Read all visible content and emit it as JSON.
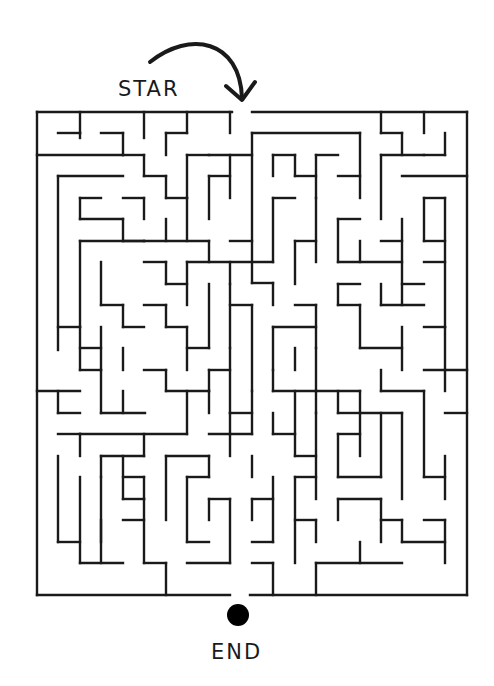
{
  "puzzle": {
    "start_label": "STAR",
    "end_label": "END",
    "wall_color": "#1a1a1a",
    "background_color": "#ffffff",
    "start_arrow": {
      "path": "M150,62 C190,30 240,40 242,98",
      "head": [
        [
          226,
          86
        ],
        [
          242,
          100
        ],
        [
          255,
          82
        ]
      ]
    },
    "end_marker": {
      "cx": 238,
      "cy": 615,
      "r": 11,
      "color": "#000000"
    },
    "entrance_gap": [
      232,
      252
    ],
    "exit_gap": [
      230,
      250
    ],
    "walls": [
      [
        37,
        112,
        232,
        112
      ],
      [
        252,
        112,
        467,
        112
      ],
      [
        37,
        112,
        37,
        595
      ],
      [
        467,
        112,
        467,
        595
      ],
      [
        37,
        595,
        230,
        595
      ],
      [
        250,
        595,
        467,
        595
      ],
      [
        37,
        155,
        123,
        155
      ],
      [
        80,
        133,
        80,
        138
      ],
      [
        58,
        133,
        80,
        133
      ],
      [
        80,
        112,
        80,
        133
      ],
      [
        101,
        133,
        123,
        133
      ],
      [
        123,
        133,
        123,
        155
      ],
      [
        144,
        112,
        144,
        138
      ],
      [
        166,
        133,
        187,
        133
      ],
      [
        187,
        112,
        187,
        133
      ],
      [
        166,
        133,
        166,
        155
      ],
      [
        123,
        155,
        144,
        155
      ],
      [
        144,
        155,
        144,
        176
      ],
      [
        144,
        176,
        166,
        176
      ],
      [
        166,
        176,
        166,
        198
      ],
      [
        187,
        155,
        209,
        155
      ],
      [
        187,
        155,
        187,
        198
      ],
      [
        209,
        155,
        252,
        155
      ],
      [
        230,
        112,
        230,
        133
      ],
      [
        58,
        176,
        58,
        350
      ],
      [
        58,
        176,
        123,
        176
      ],
      [
        80,
        198,
        80,
        219
      ],
      [
        80,
        198,
        101,
        198
      ],
      [
        80,
        219,
        123,
        219
      ],
      [
        123,
        219,
        123,
        241
      ],
      [
        123,
        241,
        144,
        241
      ],
      [
        123,
        198,
        144,
        198
      ],
      [
        144,
        198,
        144,
        219
      ],
      [
        166,
        198,
        187,
        198
      ],
      [
        187,
        198,
        187,
        241
      ],
      [
        166,
        219,
        166,
        241
      ],
      [
        144,
        241,
        209,
        241
      ],
      [
        209,
        176,
        230,
        176
      ],
      [
        209,
        176,
        209,
        219
      ],
      [
        230,
        155,
        230,
        198
      ],
      [
        230,
        241,
        252,
        241
      ],
      [
        252,
        133,
        252,
        283
      ],
      [
        252,
        133,
        360,
        133
      ],
      [
        273,
        155,
        295,
        155
      ],
      [
        273,
        155,
        273,
        176
      ],
      [
        295,
        155,
        295,
        176
      ],
      [
        295,
        176,
        316,
        176
      ],
      [
        316,
        155,
        316,
        198
      ],
      [
        316,
        155,
        338,
        155
      ],
      [
        273,
        198,
        295,
        198
      ],
      [
        273,
        198,
        273,
        262
      ],
      [
        338,
        176,
        360,
        176
      ],
      [
        360,
        133,
        360,
        198
      ],
      [
        381,
        112,
        381,
        133
      ],
      [
        381,
        133,
        402,
        133
      ],
      [
        402,
        133,
        402,
        155
      ],
      [
        424,
        112,
        424,
        133
      ],
      [
        445,
        133,
        445,
        155
      ],
      [
        424,
        155,
        445,
        155
      ],
      [
        381,
        155,
        424,
        155
      ],
      [
        381,
        155,
        381,
        219
      ],
      [
        402,
        176,
        467,
        176
      ],
      [
        424,
        198,
        445,
        198
      ],
      [
        424,
        198,
        424,
        241
      ],
      [
        80,
        241,
        80,
        327
      ],
      [
        80,
        241,
        144,
        241
      ],
      [
        101,
        262,
        101,
        305
      ],
      [
        101,
        305,
        123,
        305
      ],
      [
        123,
        305,
        123,
        327
      ],
      [
        123,
        327,
        144,
        327
      ],
      [
        144,
        262,
        166,
        262
      ],
      [
        166,
        262,
        166,
        284
      ],
      [
        166,
        284,
        187,
        284
      ],
      [
        187,
        262,
        187,
        305
      ],
      [
        187,
        262,
        273,
        262
      ],
      [
        209,
        241,
        209,
        262
      ],
      [
        230,
        262,
        230,
        284
      ],
      [
        252,
        283,
        273,
        283
      ],
      [
        273,
        283,
        273,
        305
      ],
      [
        295,
        241,
        295,
        284
      ],
      [
        295,
        241,
        316,
        241
      ],
      [
        316,
        198,
        316,
        262
      ],
      [
        338,
        219,
        360,
        219
      ],
      [
        338,
        219,
        338,
        262
      ],
      [
        338,
        262,
        402,
        262
      ],
      [
        360,
        241,
        360,
        262
      ],
      [
        381,
        241,
        402,
        241
      ],
      [
        402,
        219,
        402,
        305
      ],
      [
        402,
        284,
        424,
        284
      ],
      [
        424,
        241,
        445,
        241
      ],
      [
        445,
        198,
        445,
        327
      ],
      [
        424,
        262,
        445,
        262
      ],
      [
        58,
        327,
        80,
        327
      ],
      [
        80,
        327,
        80,
        370
      ],
      [
        80,
        348,
        101,
        348
      ],
      [
        101,
        327,
        101,
        370
      ],
      [
        123,
        348,
        123,
        370
      ],
      [
        144,
        305,
        166,
        305
      ],
      [
        166,
        305,
        166,
        327
      ],
      [
        166,
        327,
        187,
        327
      ],
      [
        187,
        327,
        187,
        370
      ],
      [
        187,
        348,
        209,
        348
      ],
      [
        209,
        284,
        209,
        348
      ],
      [
        230,
        284,
        230,
        348
      ],
      [
        230,
        305,
        252,
        305
      ],
      [
        252,
        305,
        252,
        391
      ],
      [
        209,
        370,
        230,
        370
      ],
      [
        230,
        348,
        230,
        413
      ],
      [
        273,
        327,
        273,
        370
      ],
      [
        273,
        327,
        316,
        327
      ],
      [
        295,
        305,
        316,
        305
      ],
      [
        316,
        305,
        316,
        348
      ],
      [
        338,
        284,
        360,
        284
      ],
      [
        338,
        284,
        338,
        305
      ],
      [
        338,
        305,
        360,
        305
      ],
      [
        360,
        305,
        360,
        348
      ],
      [
        360,
        348,
        402,
        348
      ],
      [
        381,
        305,
        424,
        305
      ],
      [
        381,
        284,
        381,
        305
      ],
      [
        402,
        327,
        402,
        370
      ],
      [
        424,
        327,
        445,
        327
      ],
      [
        445,
        327,
        445,
        370
      ],
      [
        424,
        370,
        467,
        370
      ],
      [
        37,
        391,
        80,
        391
      ],
      [
        58,
        391,
        58,
        413
      ],
      [
        58,
        413,
        80,
        413
      ],
      [
        80,
        370,
        101,
        370
      ],
      [
        101,
        370,
        101,
        413
      ],
      [
        101,
        413,
        145,
        413
      ],
      [
        123,
        391,
        123,
        413
      ],
      [
        144,
        370,
        166,
        370
      ],
      [
        166,
        370,
        166,
        391
      ],
      [
        166,
        391,
        209,
        391
      ],
      [
        209,
        370,
        209,
        391
      ],
      [
        187,
        391,
        187,
        434
      ],
      [
        209,
        391,
        209,
        413
      ],
      [
        230,
        413,
        252,
        413
      ],
      [
        230,
        413,
        230,
        434
      ],
      [
        252,
        391,
        252,
        434
      ],
      [
        273,
        370,
        273,
        391
      ],
      [
        273,
        391,
        316,
        391
      ],
      [
        295,
        348,
        295,
        370
      ],
      [
        316,
        348,
        316,
        413
      ],
      [
        316,
        391,
        360,
        391
      ],
      [
        338,
        391,
        338,
        413
      ],
      [
        338,
        413,
        360,
        413
      ],
      [
        360,
        391,
        360,
        456
      ],
      [
        381,
        370,
        381,
        391
      ],
      [
        381,
        391,
        424,
        391
      ],
      [
        424,
        391,
        424,
        477
      ],
      [
        445,
        370,
        445,
        391
      ],
      [
        58,
        434,
        80,
        434
      ],
      [
        80,
        434,
        80,
        456
      ],
      [
        58,
        456,
        58,
        542
      ],
      [
        58,
        542,
        80,
        542
      ],
      [
        80,
        434,
        187,
        434
      ],
      [
        101,
        456,
        101,
        477
      ],
      [
        101,
        456,
        144,
        456
      ],
      [
        144,
        434,
        144,
        456
      ],
      [
        101,
        477,
        101,
        542
      ],
      [
        123,
        477,
        144,
        477
      ],
      [
        123,
        456,
        123,
        499
      ],
      [
        144,
        477,
        144,
        499
      ],
      [
        166,
        456,
        166,
        520
      ],
      [
        166,
        456,
        209,
        456
      ],
      [
        187,
        477,
        209,
        477
      ],
      [
        187,
        477,
        187,
        542
      ],
      [
        209,
        456,
        209,
        477
      ],
      [
        209,
        434,
        252,
        434
      ],
      [
        230,
        434,
        230,
        456
      ],
      [
        252,
        456,
        252,
        477
      ],
      [
        273,
        413,
        273,
        434
      ],
      [
        273,
        434,
        295,
        434
      ],
      [
        295,
        391,
        295,
        456
      ],
      [
        295,
        456,
        316,
        456
      ],
      [
        316,
        413,
        316,
        499
      ],
      [
        338,
        434,
        360,
        434
      ],
      [
        338,
        434,
        338,
        477
      ],
      [
        338,
        477,
        381,
        477
      ],
      [
        381,
        413,
        381,
        477
      ],
      [
        360,
        413,
        402,
        413
      ],
      [
        402,
        413,
        402,
        499
      ],
      [
        424,
        477,
        445,
        477
      ],
      [
        445,
        456,
        445,
        499
      ],
      [
        445,
        413,
        467,
        413
      ],
      [
        80,
        477,
        80,
        563
      ],
      [
        80,
        563,
        123,
        563
      ],
      [
        123,
        499,
        144,
        499
      ],
      [
        123,
        520,
        144,
        520
      ],
      [
        144,
        499,
        144,
        563
      ],
      [
        101,
        520,
        101,
        563
      ],
      [
        144,
        563,
        166,
        563
      ],
      [
        166,
        563,
        166,
        595
      ],
      [
        187,
        542,
        209,
        542
      ],
      [
        187,
        563,
        230,
        563
      ],
      [
        209,
        499,
        230,
        499
      ],
      [
        209,
        499,
        209,
        520
      ],
      [
        230,
        499,
        230,
        563
      ],
      [
        252,
        499,
        273,
        499
      ],
      [
        252,
        499,
        252,
        520
      ],
      [
        273,
        477,
        273,
        542
      ],
      [
        252,
        542,
        273,
        542
      ],
      [
        295,
        477,
        316,
        477
      ],
      [
        295,
        477,
        295,
        563
      ],
      [
        295,
        520,
        316,
        520
      ],
      [
        316,
        520,
        316,
        542
      ],
      [
        338,
        499,
        381,
        499
      ],
      [
        338,
        499,
        338,
        520
      ],
      [
        381,
        520,
        402,
        520
      ],
      [
        381,
        499,
        381,
        542
      ],
      [
        402,
        520,
        402,
        542
      ],
      [
        316,
        563,
        402,
        563
      ],
      [
        402,
        542,
        445,
        542
      ],
      [
        445,
        520,
        445,
        563
      ],
      [
        424,
        520,
        445,
        520
      ],
      [
        316,
        563,
        316,
        595
      ],
      [
        360,
        542,
        360,
        563
      ],
      [
        273,
        563,
        273,
        595
      ],
      [
        252,
        563,
        273,
        563
      ]
    ]
  }
}
